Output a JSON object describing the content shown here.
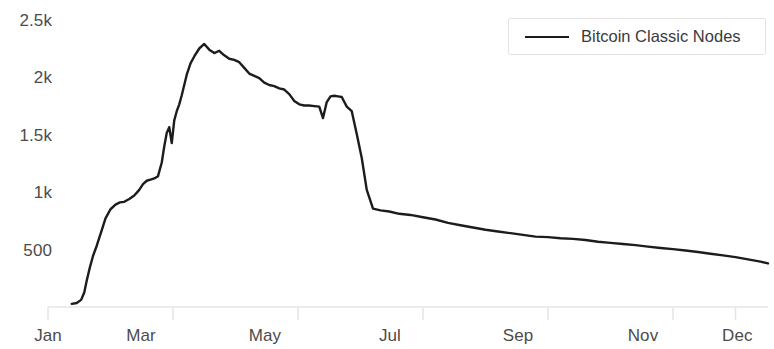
{
  "chart_data": {
    "type": "line",
    "title": "",
    "xlabel": "",
    "ylabel": "",
    "grid": false,
    "legend_position": "top-right",
    "xlim": [
      0,
      11.52
    ],
    "ylim": [
      0,
      2500
    ],
    "x_tick_labels": [
      "Jan",
      "Mar",
      "May",
      "Jul",
      "Sep",
      "Nov",
      "Dec"
    ],
    "x_tick_values": [
      0,
      2,
      4,
      6,
      8,
      10,
      11
    ],
    "y_tick_labels": [
      "500",
      "1k",
      "1.5k",
      "2k",
      "2.5k"
    ],
    "y_tick_values": [
      500,
      1000,
      1500,
      2000,
      2500
    ],
    "line_color": "#1c1c1c",
    "axis_color": "#e6e6e6",
    "tick_label_color": "#4c4c4c",
    "series": [
      {
        "name": "Bitcoin Classic Nodes",
        "color": "#1c1c1c",
        "x": [
          0.38,
          0.46,
          0.53,
          0.58,
          0.62,
          0.67,
          0.72,
          0.78,
          0.85,
          0.92,
          1.0,
          1.08,
          1.15,
          1.22,
          1.3,
          1.38,
          1.46,
          1.52,
          1.58,
          1.64,
          1.7,
          1.76,
          1.82,
          1.86,
          1.9,
          1.94,
          1.98,
          2.02,
          2.06,
          2.1,
          2.14,
          2.18,
          2.22,
          2.28,
          2.34,
          2.42,
          2.5,
          2.58,
          2.66,
          2.74,
          2.82,
          2.9,
          2.98,
          3.06,
          3.14,
          3.22,
          3.3,
          3.38,
          3.46,
          3.54,
          3.62,
          3.7,
          3.78,
          3.86,
          3.94,
          4.02,
          4.1,
          4.18,
          4.26,
          4.34,
          4.4,
          4.46,
          4.52,
          4.58,
          4.64,
          4.7,
          4.78,
          4.86,
          4.94,
          5.02,
          5.1,
          5.2,
          5.32,
          5.46,
          5.62,
          5.8,
          6.0,
          6.2,
          6.4,
          6.6,
          6.8,
          7.0,
          7.2,
          7.4,
          7.6,
          7.8,
          8.0,
          8.2,
          8.4,
          8.6,
          8.8,
          9.0,
          9.2,
          9.4,
          9.6,
          9.8,
          10.0,
          10.2,
          10.4,
          10.6,
          10.8,
          11.0,
          11.2,
          11.4,
          11.52
        ],
        "y": [
          10,
          18,
          45,
          110,
          215,
          330,
          430,
          520,
          640,
          760,
          840,
          880,
          900,
          905,
          930,
          960,
          1010,
          1060,
          1090,
          1100,
          1110,
          1130,
          1250,
          1390,
          1510,
          1560,
          1420,
          1620,
          1700,
          1760,
          1840,
          1930,
          2020,
          2120,
          2180,
          2250,
          2290,
          2240,
          2210,
          2230,
          2190,
          2160,
          2150,
          2130,
          2080,
          2030,
          2010,
          1990,
          1950,
          1930,
          1920,
          1900,
          1890,
          1850,
          1790,
          1760,
          1750,
          1750,
          1745,
          1740,
          1640,
          1780,
          1830,
          1835,
          1830,
          1825,
          1740,
          1700,
          1500,
          1290,
          1010,
          845,
          830,
          820,
          800,
          790,
          770,
          750,
          720,
          700,
          680,
          660,
          645,
          630,
          615,
          600,
          595,
          585,
          580,
          570,
          555,
          545,
          535,
          525,
          512,
          500,
          490,
          478,
          465,
          450,
          435,
          420,
          400,
          380,
          365
        ],
        "peak_value": 2290,
        "peak_month": "April",
        "final_value": 365
      }
    ]
  },
  "legend": {
    "items": [
      {
        "label": "Bitcoin Classic Nodes",
        "swatch": "line-swatch"
      }
    ]
  },
  "y_axis": {
    "labels": [
      {
        "text": "2.5k",
        "value": 2500
      },
      {
        "text": "2k",
        "value": 2000
      },
      {
        "text": "1.5k",
        "value": 1500
      },
      {
        "text": "1k",
        "value": 1000
      },
      {
        "text": "500",
        "value": 500
      }
    ]
  },
  "x_axis": {
    "labels": [
      {
        "text": "Jan"
      },
      {
        "text": "Mar"
      },
      {
        "text": "May"
      },
      {
        "text": "Jul"
      },
      {
        "text": "Sep"
      },
      {
        "text": "Nov"
      },
      {
        "text": "Dec"
      }
    ]
  }
}
